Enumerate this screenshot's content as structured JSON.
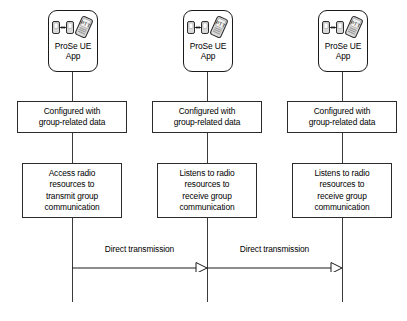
{
  "diagram": {
    "type": "sequence-diagram",
    "title": "",
    "background_color": "#ffffff",
    "line_color": "#3a3a3a",
    "box_border_color": "#2b2b2b",
    "icon_fill_color": "#d9d9d9"
  },
  "actors": [
    {
      "id": "actor-1",
      "icon_name": "prose-ue-app-icon",
      "icon_label": "PTT",
      "caption": "ProSe UE\nApp"
    },
    {
      "id": "actor-2",
      "icon_name": "prose-ue-app-icon",
      "icon_label": "PTT",
      "caption": "ProSe UE\nApp"
    },
    {
      "id": "actor-3",
      "icon_name": "prose-ue-app-icon",
      "icon_label": "PTT",
      "caption": "ProSe UE\nApp"
    }
  ],
  "steps": [
    {
      "id": "step-1-config",
      "column": 1,
      "text": "Configured with\ngroup-related data"
    },
    {
      "id": "step-2-config",
      "column": 2,
      "text": "Configured with\ngroup-related data"
    },
    {
      "id": "step-3-config",
      "column": 3,
      "text": "Configured with\ngroup-related data"
    },
    {
      "id": "step-1-radio",
      "column": 1,
      "text": "Access radio\nresources to\ntransmit group\ncommunication"
    },
    {
      "id": "step-2-radio",
      "column": 2,
      "text": "Listens to radio\nresources to\nreceive group\ncommunication"
    },
    {
      "id": "step-3-radio",
      "column": 3,
      "text": "Listens to radio\nresources to\nreceive group\ncommunication"
    }
  ],
  "messages": [
    {
      "id": "message-1",
      "label": "Direct transmission",
      "from": "actor-1",
      "to": "actor-2",
      "direction": "right",
      "arrow_style": "open-block"
    },
    {
      "id": "message-2",
      "label": "Direct transmission",
      "from": "actor-2",
      "to": "actor-3",
      "direction": "right",
      "arrow_style": "open-block"
    }
  ]
}
